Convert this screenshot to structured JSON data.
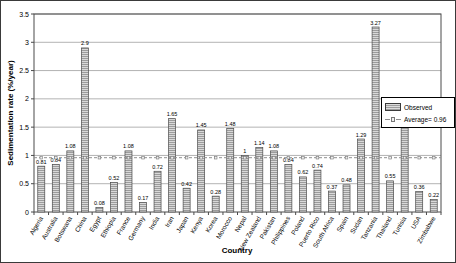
{
  "chart_data": {
    "type": "bar",
    "title": "",
    "xlabel": "Country",
    "ylabel": "Sedimentation rate (%/year)",
    "ylim": [
      0,
      3.5
    ],
    "ytick_step": 0.5,
    "ytick_labels": [
      "0",
      "0.5",
      "1",
      "1.5",
      "2",
      "2.5",
      "3",
      "3.5"
    ],
    "grid": true,
    "legend_position": "right-inside",
    "categories": [
      "Algeria",
      "Australia",
      "Botswana",
      "China",
      "Egypt",
      "Ethiopia",
      "France",
      "Germany",
      "India",
      "Iran",
      "Japan",
      "Kenya",
      "Korea",
      "Morocco",
      "Nepal",
      "New Zealand",
      "Pakistan",
      "Philippines",
      "Poland",
      "Puerto Rico",
      "South Africa",
      "Spain",
      "Sudan",
      "Tanzania",
      "Thailand",
      "Tunisia",
      "USA",
      "Zimbabwe"
    ],
    "values": [
      0.81,
      0.84,
      1.08,
      2.9,
      0.08,
      0.52,
      1.08,
      0.17,
      0.72,
      1.65,
      0.42,
      1.45,
      0.28,
      1.48,
      1,
      1.14,
      1.08,
      0.84,
      0.62,
      0.74,
      0.37,
      0.48,
      1.29,
      3.27,
      0.55,
      1.73,
      0.36,
      0.22
    ],
    "value_labels": [
      "0.81",
      "0.84",
      "1.08",
      "2.9",
      "0.08",
      "0.52",
      "1.08",
      "0.17",
      "0.72",
      "1.65",
      "0.42",
      "1.45",
      "0.28",
      "1.48",
      "1",
      "1.14",
      "1.08",
      "0.84",
      "0.62",
      "0.74",
      "0.37",
      "0.48",
      "1.29",
      "3.27",
      "0.55",
      "1.73",
      "0.36",
      "0.22"
    ],
    "average_line": {
      "value": 0.96,
      "label": "Average= 0.96"
    },
    "legend": {
      "observed_label": "Observed",
      "average_label": "Average= 0.96"
    },
    "colors": {
      "bar_fill": "#d9d9d9",
      "bar_hatch": "#9c9c9c",
      "bar_border": "#4a4a4a",
      "grid": "#b3b3b3",
      "plot_border": "#4a4a4a",
      "average_line": "#8f8f8f",
      "text": "#000000",
      "background": "#ffffff"
    }
  }
}
